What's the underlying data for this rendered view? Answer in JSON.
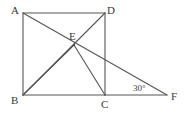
{
  "figure": {
    "kind": "geometry-diagram",
    "stroke_color": "#555555",
    "label_color": "#3a3a3a",
    "background_color": "#ffffff",
    "labels": {
      "A": "A",
      "B": "B",
      "C": "C",
      "D": "D",
      "E": "E",
      "F": "F",
      "angle_at_F": "30°"
    },
    "points": {
      "A": {
        "x": 23,
        "y": 13
      },
      "D": {
        "x": 105,
        "y": 13
      },
      "B": {
        "x": 23,
        "y": 95
      },
      "C": {
        "x": 105,
        "y": 95
      },
      "E": {
        "x": 74,
        "y": 45
      },
      "F": {
        "x": 167,
        "y": 95
      }
    },
    "segments": [
      {
        "name": "side-AD",
        "from": "A",
        "to": "D"
      },
      {
        "name": "side-AB",
        "from": "A",
        "to": "B"
      },
      {
        "name": "side-DC",
        "from": "D",
        "to": "C"
      },
      {
        "name": "side-BC",
        "from": "B",
        "to": "C"
      },
      {
        "name": "diagonal-BD",
        "from": "B",
        "to": "D"
      },
      {
        "name": "line-A-to-F",
        "from": "A",
        "to": "F"
      },
      {
        "name": "segment-E-to-B",
        "from": "E",
        "to": "B"
      },
      {
        "name": "segment-E-to-C",
        "from": "E",
        "to": "C"
      },
      {
        "name": "baseline-C-to-F",
        "from": "C",
        "to": "F"
      }
    ]
  }
}
